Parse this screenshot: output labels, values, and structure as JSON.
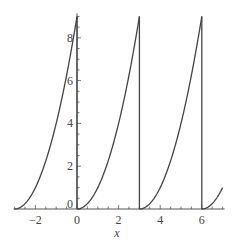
{
  "chart_data": {
    "type": "line",
    "title": "",
    "xlabel": "x",
    "ylabel": "",
    "xlim": [
      -3,
      7
    ],
    "ylim": [
      0,
      9
    ],
    "grid": false,
    "legend": null,
    "x_ticks": [
      -2,
      0,
      2,
      4,
      6
    ],
    "x_tick_labels": [
      "−2",
      "0",
      "2",
      "4",
      "6"
    ],
    "y_ticks": [
      0,
      2,
      4,
      6,
      8
    ],
    "y_tick_labels": [
      "0",
      "2",
      "4",
      "6",
      "8"
    ],
    "series": [
      {
        "name": "f(x)",
        "color": "#444444",
        "segments": [
          {
            "x_start": -3,
            "x_end": 0,
            "formula": "(x+3)^2",
            "points": [
              [
                -3,
                0
              ],
              [
                -2.5,
                0.25
              ],
              [
                -2,
                1
              ],
              [
                -1.5,
                2.25
              ],
              [
                -1,
                4
              ],
              [
                -0.5,
                6.25
              ],
              [
                0,
                9
              ]
            ]
          },
          {
            "x_start": 0,
            "x_end": 3,
            "formula": "x^2",
            "points": [
              [
                0,
                0
              ],
              [
                0.5,
                0.25
              ],
              [
                1,
                1
              ],
              [
                1.5,
                2.25
              ],
              [
                2,
                4
              ],
              [
                2.5,
                6.25
              ],
              [
                3,
                9
              ]
            ]
          },
          {
            "x_start": 3,
            "x_end": 6,
            "formula": "(x-3)^2",
            "points": [
              [
                3,
                0
              ],
              [
                3.5,
                0.25
              ],
              [
                4,
                1
              ],
              [
                4.5,
                2.25
              ],
              [
                5,
                4
              ],
              [
                5.5,
                6.25
              ],
              [
                6,
                9
              ]
            ]
          },
          {
            "x_start": 6,
            "x_end": 7,
            "formula": "(x-6)^2",
            "points": [
              [
                6,
                0
              ],
              [
                6.5,
                0.25
              ],
              [
                7,
                1
              ]
            ]
          }
        ],
        "vertical_jumps": [
          [
            0,
            9,
            0
          ],
          [
            3,
            9,
            0
          ],
          [
            6,
            9,
            0
          ]
        ]
      }
    ]
  }
}
